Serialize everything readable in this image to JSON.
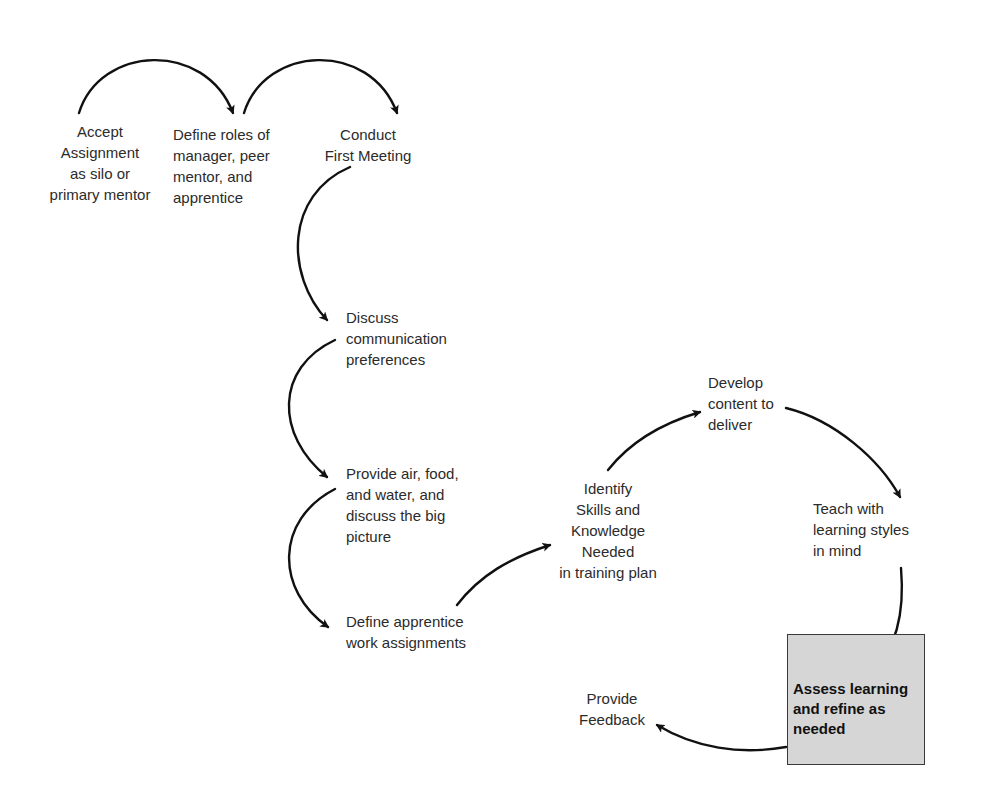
{
  "diagram": {
    "type": "process-flow",
    "stroke_color": "#111111",
    "highlight_fill": "#d6d6d6",
    "steps": [
      {
        "id": "accept",
        "label": "Accept\nAssignment\nas silo or\nprimary mentor"
      },
      {
        "id": "define-roles",
        "label": "Define roles of\nmanager, peer\nmentor, and\napprentice"
      },
      {
        "id": "first-meeting",
        "label": "Conduct\nFirst Meeting"
      },
      {
        "id": "communication",
        "label": "Discuss\ncommunication\npreferences"
      },
      {
        "id": "big-picture",
        "label": "Provide air, food,\nand water, and\ndiscuss the big\npicture"
      },
      {
        "id": "work-assignments",
        "label": "Define apprentice\nwork assignments"
      },
      {
        "id": "identify-skills",
        "label": "Identify\nSkills and\nKnowledge\nNeeded\nin training plan"
      },
      {
        "id": "develop-content",
        "label": "Develop\ncontent to\ndeliver"
      },
      {
        "id": "teach",
        "label": "Teach with\nlearning styles\nin mind"
      },
      {
        "id": "assess",
        "label": "Assess learning\nand refine as\nneeded",
        "highlighted": true
      },
      {
        "id": "feedback",
        "label": "Provide\nFeedback"
      }
    ],
    "edges": [
      {
        "from": "accept",
        "to": "define-roles"
      },
      {
        "from": "define-roles",
        "to": "first-meeting"
      },
      {
        "from": "first-meeting",
        "to": "communication"
      },
      {
        "from": "communication",
        "to": "big-picture"
      },
      {
        "from": "big-picture",
        "to": "work-assignments"
      },
      {
        "from": "work-assignments",
        "to": "identify-skills"
      },
      {
        "from": "identify-skills",
        "to": "develop-content"
      },
      {
        "from": "develop-content",
        "to": "teach"
      },
      {
        "from": "teach",
        "to": "assess"
      },
      {
        "from": "assess",
        "to": "feedback"
      }
    ]
  }
}
